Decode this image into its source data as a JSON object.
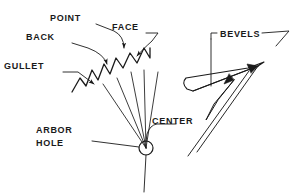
{
  "figure": {
    "style": {
      "ink": "#1a1a1a",
      "background": "#ffffff",
      "stroke_width": 1.1
    }
  },
  "labels": {
    "point": "POINT",
    "back": "BACK",
    "face": "FACE",
    "gullet": "GULLET",
    "center": "CENTER",
    "arbor_hole_line1": "ARBOR",
    "arbor_hole_line2": "HOLE",
    "bevels": "BEVELS"
  },
  "geometry": {
    "sawtooth_path": "M 72,92 L 80,78 L 86,86 L 92,70 L 98,80 L 104,64 L 110,74 L 116,58 L 123,68 L 130,53 L 137,63 L 144,48 L 150,58 L 150,48",
    "radiating_lines": [
      "M 146,148 L 103,84",
      "M 146,148 L 117,78",
      "M 146,148 L 131,72",
      "M 146,148 L 144,70",
      "M 146,148 L 158,72"
    ],
    "center_circle": {
      "cx": 146,
      "cy": 148,
      "r": 7
    },
    "arbor_spindle": "M 146,155 L 144,192",
    "arbor_leader": "M 92,141 L 139,147",
    "center_leader": "M 178,124 L 157,124 Q 150,125 147,134 L 146,142",
    "point_leader": "M 96,24 L 114,31 Q 124,36 124,50",
    "back_leader": "M 72,43 L 88,48 Q 104,54 108,66",
    "face_leader": "M 146,33 L 158,33 L 152,41 Q 142,50 136,58",
    "gullet_leader": "M 63,72 L 78,72 L 96,86",
    "bevel_outline": "M 186,78 Q 182,82 186,88 L 192,90 L 256,67 L 262,63 L 246,69 Z",
    "bevel_tip_upper": "M 262,63 L 268,66 L 258,68",
    "bevel_facet_a": "M 192,90 L 256,67",
    "bevel_facet_b": "M 232,79 L 215,102 L 208,118 L 216,100 Z",
    "bevel_long_edge_1": "M 256,67 L 196,150",
    "bevel_long_edge_2": "M 248,72 L 188,154",
    "bevel_tip_arrow": "M 232,79 L 224,84 L 228,74",
    "bevels_bracket": "M 212,39 L 212,33 L 216,33",
    "bevels_stem": "M 212,39 L 212,84",
    "bevels_right_leader": "M 262,33 L 288,33 L 276,46",
    "bevel_upper_arrow": "M 256,67 L 246,65 L 250,74"
  },
  "text_positions": {
    "point": {
      "x": 50,
      "y": 21
    },
    "back": {
      "x": 26,
      "y": 40
    },
    "face": {
      "x": 112,
      "y": 30
    },
    "gullet": {
      "x": 4,
      "y": 69
    },
    "center": {
      "x": 152,
      "y": 124
    },
    "arbor_line1": {
      "x": 36,
      "y": 133
    },
    "arbor_line2": {
      "x": 36,
      "y": 146
    },
    "bevels": {
      "x": 220,
      "y": 36
    }
  }
}
